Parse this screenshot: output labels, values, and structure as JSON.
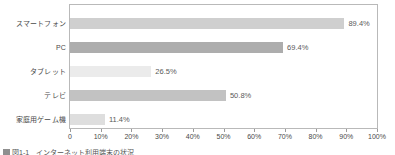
{
  "chart_data": {
    "type": "bar",
    "orientation": "horizontal",
    "title": "",
    "xlabel": "",
    "ylabel": "",
    "xlim": [
      0,
      100
    ],
    "grid": false,
    "legend": "none",
    "categories": [
      "スマートフォン",
      "PC",
      "タブレット",
      "テレビ",
      "家庭用ゲーム機"
    ],
    "values": [
      89.4,
      69.4,
      26.5,
      50.8,
      11.4
    ],
    "value_labels": [
      "89.4%",
      "69.4%",
      "26.5%",
      "50.8%",
      "11.4%"
    ],
    "bar_colors": [
      "#cfcfcf",
      "#adadad",
      "#ebebeb",
      "#c2c2c2",
      "#dedede"
    ],
    "tick_values": [
      0,
      10,
      20,
      30,
      40,
      50,
      60,
      70,
      80,
      90,
      100
    ],
    "tick_labels": [
      "0",
      "10%",
      "20%",
      "30%",
      "40%",
      "50%",
      "60%",
      "70%",
      "80%",
      "90%",
      "100%"
    ]
  },
  "caption": {
    "swatch_color": "#8f8f8f",
    "text": "図1-1　インターネット利用端末の状況"
  },
  "style": {
    "frame_color": "#b9b9b9",
    "text_color": "#4a4a4a"
  }
}
